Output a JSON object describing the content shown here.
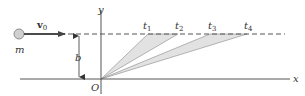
{
  "diagram": {
    "particle": {
      "label": "m"
    },
    "velocity": {
      "label": "v",
      "subscript": "0"
    },
    "distance": {
      "label": "b"
    },
    "axes": {
      "x_label": "x",
      "y_label": "y",
      "origin_label": "O"
    },
    "time_points": [
      {
        "label": "t",
        "subscript": "1"
      },
      {
        "label": "t",
        "subscript": "2"
      },
      {
        "label": "t",
        "subscript": "3"
      },
      {
        "label": "t",
        "subscript": "4"
      }
    ],
    "swept_areas": [
      {
        "from": "t1",
        "to": "t2"
      },
      {
        "from": "t3",
        "to": "t4"
      }
    ],
    "colors": {
      "line": "#555555",
      "arrow": "#4a4a4a",
      "shade": "#e2e2e2",
      "particle_fill": "#d0d0d0"
    }
  }
}
